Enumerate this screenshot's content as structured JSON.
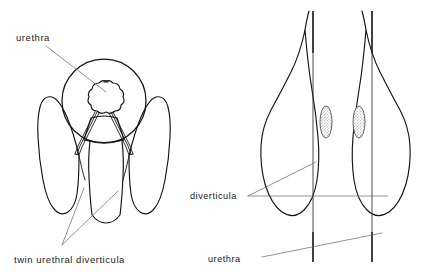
{
  "figure": {
    "background_color": "#ffffff",
    "ink_color": "#141414",
    "leader_color": "#6d6d6d",
    "width": 447,
    "height": 272
  },
  "labels": {
    "urethra_left": "urethra",
    "twin_urethral_diverticula": "twin urethral diverticula",
    "diverticula_right": "diverticula",
    "urethra_right": "urethra"
  },
  "panels": {
    "left": {
      "name": "axial-view",
      "description": "Axial/frontal schematic: round urethral ring enclosing a scalloped urethral lumen, with paired ducts descending to two wing-shaped diverticula",
      "structures": [
        "urethral-ring",
        "scalloped-urethral-lumen",
        "paired-ducts",
        "left-diverticulum-wing",
        "right-diverticulum-wing",
        "central-column"
      ]
    },
    "right": {
      "name": "contrast-study-view",
      "description": "Two leaf-shaped contrast-filled outlines, each traversed by a vertical urethral line and containing a stippled oval diverticulum",
      "structures": [
        "left-leaf-outline",
        "right-leaf-outline",
        "left-urethra-line",
        "right-urethra-line",
        "left-diverticulum-oval",
        "right-diverticulum-oval"
      ]
    }
  }
}
